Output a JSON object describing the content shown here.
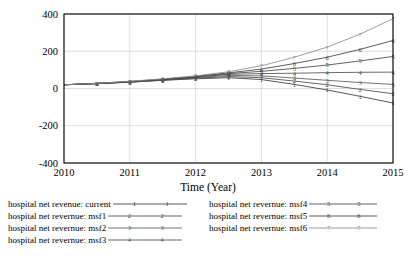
{
  "chart_data": {
    "type": "line",
    "title": "",
    "xlabel": "Time (Year)",
    "ylabel": "",
    "xlim": [
      2010,
      2015
    ],
    "ylim": [
      -400,
      400
    ],
    "xticks": [
      "2010",
      "2011",
      "2012",
      "2013",
      "2014",
      "2015"
    ],
    "yticks": [
      "400",
      "200",
      "0",
      "-200",
      "-400"
    ],
    "grid": true,
    "legend_position": "bottom",
    "x": [
      2010,
      2010.5,
      2011,
      2011.5,
      2012,
      2012.5,
      2013,
      2013.5,
      2014,
      2014.5,
      2015
    ],
    "series": [
      {
        "name": "hospital net revenue: current",
        "marker": "1",
        "color": "#3a3a3a",
        "values": [
          20,
          26,
          34,
          44,
          52,
          58,
          48,
          22,
          -8,
          -42,
          -78
        ]
      },
      {
        "name": "hospital net revernue: msf1",
        "marker": "2",
        "color": "#4a4a4a",
        "values": [
          20,
          26,
          34,
          45,
          55,
          64,
          58,
          40,
          20,
          -5,
          -28
        ]
      },
      {
        "name": "hospital net revernue: msf2",
        "marker": "3",
        "color": "#5a5a5a",
        "values": [
          20,
          27,
          35,
          46,
          58,
          70,
          68,
          56,
          44,
          32,
          22
        ]
      },
      {
        "name": "hospital net revernue: msf3",
        "marker": "4",
        "color": "#505050",
        "values": [
          20,
          27,
          36,
          47,
          60,
          76,
          80,
          82,
          85,
          87,
          88
        ]
      },
      {
        "name": "hospital net revernue: msf4",
        "marker": "5",
        "color": "#454545",
        "values": [
          20,
          27,
          37,
          48,
          62,
          80,
          92,
          108,
          126,
          148,
          172
        ]
      },
      {
        "name": "hospital net revernue: msf5",
        "marker": "6",
        "color": "#3f3f3f",
        "values": [
          20,
          28,
          38,
          50,
          65,
          84,
          104,
          134,
          168,
          210,
          258
        ]
      },
      {
        "name": "hospital net revernue: msf6",
        "marker": "7",
        "color": "#8c8c8c",
        "values": [
          20,
          28,
          39,
          52,
          68,
          90,
          122,
          168,
          222,
          292,
          375
        ]
      }
    ]
  },
  "legend": {
    "left_column": [
      {
        "label": "hospital net revenue: current",
        "marker": "1"
      },
      {
        "label": "hospital net revernue: msf1",
        "marker": "2"
      },
      {
        "label": "hospital net revernue: msf2",
        "marker": "3"
      },
      {
        "label": "hospital net revernue: msf3",
        "marker": "4"
      }
    ],
    "right_column": [
      {
        "label": "hospital net revernue: msf4",
        "marker": "5"
      },
      {
        "label": "hospital net revernue: msf5",
        "marker": "6"
      },
      {
        "label": "hospital net revernue: msf6",
        "marker": "7"
      }
    ]
  }
}
